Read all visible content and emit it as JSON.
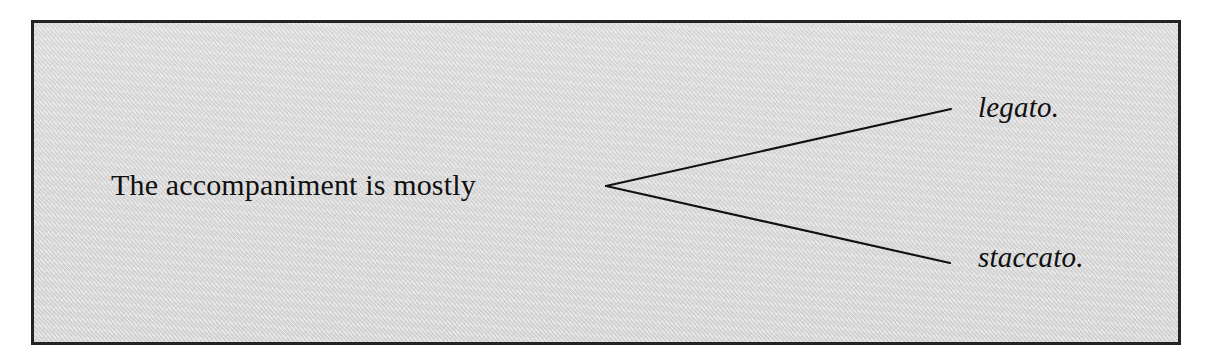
{
  "figure": {
    "frame": {
      "border_color": "#242424",
      "background_color": "#d8d8d8",
      "page_background_color": "#ffffff"
    },
    "stem": {
      "text": "The accompaniment is mostly"
    },
    "connector": {
      "name": "brace",
      "line_color": "#111111",
      "vertex": "603,183",
      "upper_endpoint": "948,106",
      "lower_endpoint": "947,260"
    },
    "branches": [
      {
        "label": "legato."
      },
      {
        "label": "staccato."
      }
    ]
  }
}
